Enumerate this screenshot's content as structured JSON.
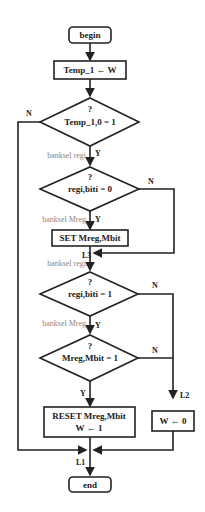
{
  "flowchart": {
    "start": "begin",
    "step1": "Temp_1 ← W",
    "dec1": {
      "q": "?",
      "cond": "Temp_1,0 = 1",
      "yes": "Y",
      "no": "N"
    },
    "bank1": "banksel regi",
    "dec2": {
      "q": "?",
      "cond": "regi,biti = 0",
      "yes": "Y",
      "no": "N"
    },
    "bank2": "banksel Mreg",
    "set": "SET Mreg,Mbit",
    "l3": "L3",
    "bank3": "banksel regi",
    "dec3": {
      "q": "?",
      "cond": "regi,biti = 1",
      "yes": "Y",
      "no": "N"
    },
    "bank4": "banksel Mreg",
    "dec4": {
      "q": "?",
      "cond": "Mreg,Mbit = 1",
      "yes": "Y",
      "no": "N"
    },
    "reset1": "RESET Mreg,Mbit",
    "reset2": "W ← 1",
    "l2": "L2",
    "w0": "W ← 0",
    "l1": "L1",
    "end": "end"
  }
}
